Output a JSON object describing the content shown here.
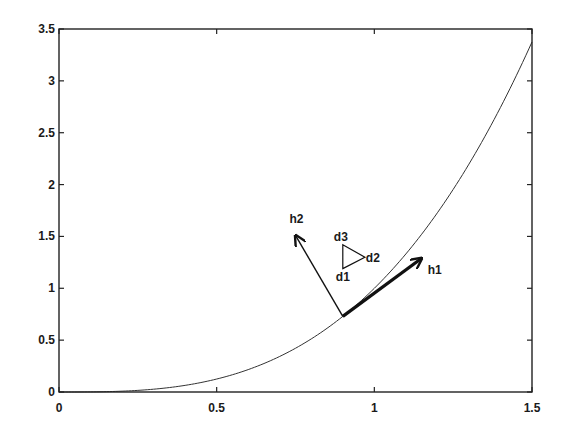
{
  "chart_data": {
    "type": "line",
    "title": "",
    "xlabel": "",
    "ylabel": "",
    "xlim": [
      0,
      1.5
    ],
    "ylim": [
      0,
      3.5
    ],
    "grid": false,
    "legend": null,
    "x_ticks": [
      "0",
      "0.5",
      "1",
      "1.5"
    ],
    "x_tick_values": [
      0,
      0.5,
      1,
      1.5
    ],
    "y_ticks": [
      "0",
      "0.5",
      "1",
      "1.5",
      "2",
      "2.5",
      "3",
      "3.5"
    ],
    "y_tick_values": [
      0,
      0.5,
      1,
      1.5,
      2,
      2.5,
      3,
      3.5
    ],
    "series": [
      {
        "name": "curve",
        "function": "y = x^3",
        "x": [
          0,
          0.1,
          0.2,
          0.3,
          0.4,
          0.5,
          0.6,
          0.7,
          0.8,
          0.9,
          1.0,
          1.1,
          1.2,
          1.3,
          1.4,
          1.5
        ],
        "y": [
          0,
          0.001,
          0.008,
          0.027,
          0.064,
          0.125,
          0.216,
          0.343,
          0.512,
          0.729,
          1.0,
          1.331,
          1.728,
          2.197,
          2.744,
          3.375
        ]
      }
    ],
    "annotations": {
      "origin": [
        0.9,
        0.729
      ],
      "vectors": [
        {
          "label": "h1",
          "from": [
            0.9,
            0.729
          ],
          "to": [
            1.15,
            1.29
          ],
          "style": "thick"
        },
        {
          "label": "h2",
          "from": [
            0.9,
            0.729
          ],
          "to": [
            0.75,
            1.51
          ],
          "style": "thin"
        }
      ],
      "triangle": {
        "vertices": [
          {
            "label": "d1",
            "at": [
              0.9,
              1.19
            ]
          },
          {
            "label": "d2",
            "at": [
              0.97,
              1.3
            ]
          },
          {
            "label": "d3",
            "at": [
              0.9,
              1.42
            ]
          }
        ]
      }
    }
  }
}
